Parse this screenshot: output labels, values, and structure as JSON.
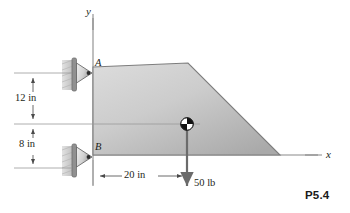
{
  "figure": {
    "number_label": "P5.4",
    "axes": {
      "y_label": "y",
      "x_label": "x"
    },
    "points": {
      "support_a_label": "A",
      "support_b_label": "B"
    },
    "dimensions": {
      "vertical_upper": "12 in",
      "vertical_lower": "8 in",
      "horizontal": "20 in"
    },
    "load": {
      "magnitude_label": "50 lb"
    },
    "colors": {
      "line": "#6e6e6e",
      "outline": "#7a7a7a",
      "plate_light": "#d8d8d8",
      "plate_dark": "#a8a8a8",
      "support_pad": "#cfcfcf",
      "support_plate": "#8f8f8f",
      "text": "#231f20",
      "force_arrow": "#6b6b6b"
    }
  }
}
